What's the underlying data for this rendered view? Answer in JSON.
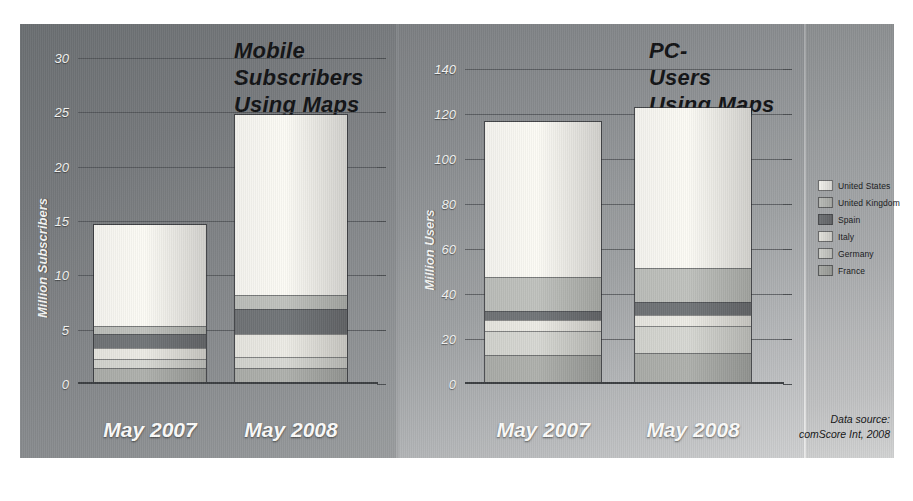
{
  "figure": {
    "source_note_line1": "Data source:",
    "source_note_line2": "comScore Int, 2008"
  },
  "legend": {
    "position": "right",
    "items": [
      {
        "label": "United States",
        "color": "#f2f1ec"
      },
      {
        "label": "United Kingdom",
        "color": "#b9bbb7"
      },
      {
        "label": "Spain",
        "color": "#6e7174"
      },
      {
        "label": "Italy",
        "color": "#e3e2dc"
      },
      {
        "label": "Germany",
        "color": "#cfd0cb"
      },
      {
        "label": "France",
        "color": "#a8aaa6"
      }
    ]
  },
  "chart_data": [
    {
      "id": "mobile",
      "type": "bar",
      "stacked": true,
      "title": "Mobile Subscribers Using Maps",
      "title_lines": [
        "Mobile",
        "Subscribers",
        "Using Maps"
      ],
      "xlabel": "",
      "ylabel": "Million Subscribers",
      "ylim": [
        0,
        30
      ],
      "yticks": [
        0,
        5,
        10,
        15,
        20,
        25,
        30
      ],
      "ytick_labels": [
        "0",
        "5",
        "10",
        "15",
        "20",
        "25",
        "30"
      ],
      "grid": true,
      "categories": [
        "May 2007",
        "May 2008"
      ],
      "series": [
        {
          "name": "France",
          "color": "#a8aaa6",
          "values": [
            1.3,
            1.3
          ]
        },
        {
          "name": "Germany",
          "color": "#cfd0cb",
          "values": [
            0.8,
            1.0
          ]
        },
        {
          "name": "Italy",
          "color": "#e3e2dc",
          "values": [
            1.1,
            2.2
          ]
        },
        {
          "name": "Spain",
          "color": "#6e7174",
          "values": [
            1.3,
            2.3
          ]
        },
        {
          "name": "United Kingdom",
          "color": "#b9bbb7",
          "values": [
            0.7,
            1.3
          ]
        },
        {
          "name": "United States",
          "color": "#f2f1ec",
          "values": [
            9.4,
            16.7
          ]
        }
      ],
      "totals": [
        14.6,
        24.8
      ]
    },
    {
      "id": "pc",
      "type": "bar",
      "stacked": true,
      "title": "PC-Users Using Maps",
      "title_lines": [
        "PC-",
        "Users",
        "Using Maps"
      ],
      "xlabel": "",
      "ylabel": "Million Users",
      "ylim": [
        0,
        145
      ],
      "yticks": [
        0,
        20,
        40,
        60,
        80,
        100,
        120,
        140
      ],
      "ytick_labels": [
        "0",
        "20",
        "40",
        "60",
        "80",
        "100",
        "120",
        "140"
      ],
      "grid": true,
      "categories": [
        "May 2007",
        "May 2008"
      ],
      "series": [
        {
          "name": "France",
          "color": "#a8aaa6",
          "values": [
            12,
            13
          ]
        },
        {
          "name": "Germany",
          "color": "#cfd0cb",
          "values": [
            11,
            12
          ]
        },
        {
          "name": "Italy",
          "color": "#e3e2dc",
          "values": [
            5,
            5
          ]
        },
        {
          "name": "Spain",
          "color": "#6e7174",
          "values": [
            4,
            6
          ]
        },
        {
          "name": "United Kingdom",
          "color": "#b9bbb7",
          "values": [
            15,
            15
          ]
        },
        {
          "name": "United States",
          "color": "#f2f1ec",
          "values": [
            70,
            72
          ]
        }
      ],
      "totals": [
        117,
        123
      ]
    }
  ]
}
